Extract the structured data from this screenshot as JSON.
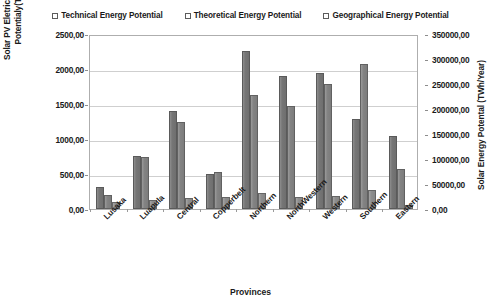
{
  "chart_data": {
    "type": "bar",
    "title": "",
    "subtitle": "",
    "xlabel": "Provinces",
    "ylabel": "Solar PV Eletricty Generation Potentialy(TWh/Year)",
    "y2label": "Solar Energy Potental (TWh/Year)",
    "categories": [
      "Lusaka",
      "Luapula",
      "Central",
      "Copperbelt",
      "Northern",
      "NorthWestern",
      "Western",
      "Southern",
      "Eastern"
    ],
    "series": [
      {
        "name": "Technical Energy Potential",
        "axis": "left",
        "values": [
          314,
          757,
          1400,
          500,
          2257,
          1900,
          1943,
          1286,
          1043
        ]
      },
      {
        "name": "Theoretical Energy Potential",
        "axis": "left",
        "values": [
          200,
          743,
          1243,
          529,
          1629,
          1471,
          1786,
          2071,
          571
        ]
      },
      {
        "name": "Geographical Energy Potential",
        "axis": "right",
        "values": [
          14000,
          18000,
          22000,
          24000,
          32000,
          25000,
          27000,
          38000,
          9000
        ]
      }
    ],
    "ylim": [
      0,
      2500
    ],
    "y2lim": [
      0,
      350000
    ],
    "yticks": [
      "0,00",
      "500,00",
      "1000,00",
      "1500,00",
      "2000,00",
      "2500,00"
    ],
    "y2ticks": [
      "0,00",
      "50000,00",
      "100000,00",
      "150000,00",
      "200000,00",
      "250000,00",
      "300000,00",
      "350000,00"
    ],
    "grid": true,
    "legend_position": "top",
    "legend": [
      "Technical Energy Potential",
      "Theoretical Energy Potential",
      "Geographical Energy Potential"
    ],
    "colors": {
      "series_0": "#767676",
      "series_1": "#838383",
      "series_2": "#8d8d8d",
      "gridline": "#cfcfcf",
      "frame": "#aeaeae",
      "text": "#1a1a1a",
      "background": "#ffffff"
    }
  }
}
